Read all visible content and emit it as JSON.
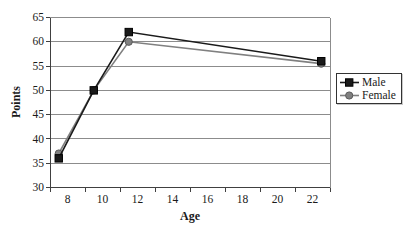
{
  "chart_data": {
    "type": "line",
    "title": "",
    "xlabel": "Age",
    "ylabel": "Points",
    "xlim": [
      7,
      23
    ],
    "ylim": [
      30,
      65
    ],
    "y_tick_step": 5,
    "y_ticks": [
      30,
      35,
      40,
      45,
      50,
      55,
      60,
      65
    ],
    "x_ticks": [
      8,
      10,
      12,
      14,
      16,
      18,
      20,
      22
    ],
    "x_tick_marks": [
      7,
      9,
      11,
      13,
      15,
      17,
      19,
      21,
      23
    ],
    "grid": "horizontal",
    "legend_position": "right-middle",
    "x": [
      7.5,
      9.5,
      11.5,
      22.5
    ],
    "series": [
      {
        "name": "Male",
        "values": [
          36,
          50,
          62,
          56
        ],
        "color": "#1a1a1a",
        "marker": "square",
        "marker_fill": "#1a1a1a",
        "marker_edge": "#000000"
      },
      {
        "name": "Female",
        "values": [
          37,
          50,
          60,
          55.5
        ],
        "color": "#808080",
        "marker": "circle",
        "marker_fill": "#808080",
        "marker_edge": "#595959"
      }
    ],
    "colors": {
      "gridline": "#8c8c8c",
      "axis": "#404040",
      "tick_label": "#1a1a1a",
      "plot_bg": "#ffffff"
    }
  },
  "labels": {
    "x_axis_title": "Age",
    "y_axis_title": "Points"
  },
  "legend": {
    "items": [
      {
        "label": "Male"
      },
      {
        "label": "Female"
      }
    ]
  }
}
